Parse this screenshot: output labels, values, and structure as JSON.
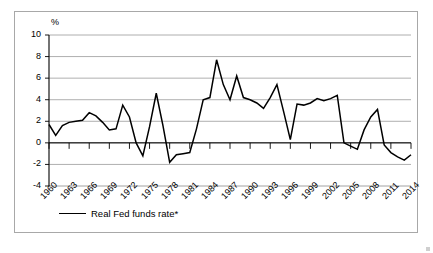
{
  "chart_data": {
    "type": "line",
    "title": "",
    "subtitle": "",
    "xlabel": "",
    "ylabel": "%",
    "ylim": [
      -4,
      10
    ],
    "xlim": [
      1960,
      2014
    ],
    "ytick_labels": [
      "10",
      "8",
      "6",
      "4",
      "2",
      "0",
      "-2",
      "-4"
    ],
    "ytick_values": [
      10,
      8,
      6,
      4,
      2,
      0,
      -2,
      -4
    ],
    "grid": true,
    "grid_axis": "y",
    "legend_position": "bottom-left",
    "legend": [
      "Real Fed funds rate*"
    ],
    "xtick_labels": [
      "1960",
      "1963",
      "1966",
      "1969",
      "1972",
      "1975",
      "1978",
      "1981",
      "1984",
      "1987",
      "1990",
      "1993",
      "1996",
      "1999",
      "2002",
      "2005",
      "2008",
      "2011",
      "2014"
    ],
    "xtick_values": [
      1960,
      1963,
      1966,
      1969,
      1972,
      1975,
      1978,
      1981,
      1984,
      1987,
      1990,
      1993,
      1996,
      1999,
      2002,
      2005,
      2008,
      2011,
      2014
    ],
    "x": [
      1960,
      1961,
      1962,
      1963,
      1964,
      1965,
      1966,
      1967,
      1968,
      1969,
      1970,
      1971,
      1972,
      1973,
      1974,
      1975,
      1976,
      1977,
      1978,
      1979,
      1980,
      1981,
      1982,
      1983,
      1984,
      1985,
      1986,
      1987,
      1988,
      1989,
      1990,
      1991,
      1992,
      1993,
      1994,
      1995,
      1996,
      1997,
      1998,
      1999,
      2000,
      2001,
      2002,
      2003,
      2004,
      2005,
      2006,
      2007,
      2008,
      2009,
      2010,
      2011,
      2012,
      2013,
      2014
    ],
    "series": [
      {
        "name": "Real Fed funds rate*",
        "color": "#000000",
        "values": [
          1.7,
          0.7,
          1.6,
          1.9,
          2.0,
          2.1,
          2.8,
          2.5,
          1.9,
          1.2,
          1.3,
          3.5,
          2.4,
          0.0,
          -1.2,
          1.5,
          4.6,
          1.6,
          -1.8,
          -1.1,
          -1.0,
          -0.9,
          1.3,
          4.0,
          4.2,
          7.7,
          5.4,
          4.0,
          6.2,
          4.2,
          4.0,
          3.7,
          3.2,
          4.2,
          5.4,
          2.9,
          0.3,
          3.6,
          3.5,
          3.7,
          4.1,
          3.9,
          4.1,
          4.4,
          0.0,
          -0.3,
          -0.6,
          1.2,
          2.4,
          3.1,
          -0.2,
          -0.9,
          -1.3,
          -1.6,
          -1.1
        ]
      }
    ]
  },
  "legend": {
    "entries": [
      {
        "label": "Real Fed funds rate*"
      }
    ]
  },
  "axis": {
    "y_unit": "%"
  }
}
